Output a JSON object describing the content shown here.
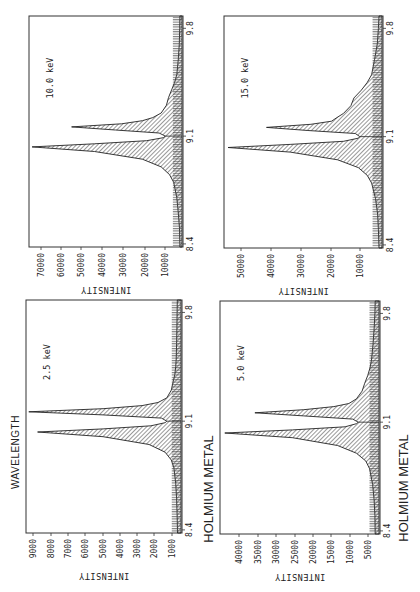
{
  "chart_data": [
    {
      "type": "area",
      "title": "10.0 keV",
      "xlabel": "WAVELENGTH",
      "ylabel": "INTENSITY",
      "x_ticks": [
        "8.4",
        "9.1",
        "9.8"
      ],
      "y_ticks": [
        "10000",
        "20000",
        "30000",
        "40000",
        "50000",
        "60000",
        "70000"
      ],
      "ylim": [
        3000,
        76000
      ],
      "xlim": [
        8.38,
        9.88
      ],
      "series": [
        {
          "name": "Holmium metal 10.0 keV",
          "x": [
            8.38,
            8.5,
            8.6,
            8.7,
            8.8,
            8.85,
            8.9,
            8.95,
            9.0,
            9.03,
            9.05,
            9.07,
            9.09,
            9.1,
            9.12,
            9.14,
            9.16,
            9.18,
            9.2,
            9.22,
            9.25,
            9.3,
            9.35,
            9.4,
            9.45,
            9.5,
            9.6,
            9.7,
            9.8,
            9.88
          ],
          "y": [
            4000,
            4200,
            4800,
            5500,
            7000,
            9000,
            13000,
            22000,
            45000,
            75000,
            45000,
            20000,
            12000,
            11000,
            14000,
            35000,
            56000,
            32000,
            22000,
            17000,
            13000,
            10500,
            9500,
            8000,
            6500,
            5500,
            4800,
            4300,
            4100,
            4000
          ]
        }
      ],
      "annotations": [
        "10.0 keV"
      ],
      "grid": false
    },
    {
      "type": "area",
      "title": "15.0 keV",
      "xlabel": "WAVELENGTH",
      "ylabel": "INTENSITY",
      "x_ticks": [
        "8.4",
        "9.1",
        "9.8"
      ],
      "y_ticks": [
        "10000",
        "20000",
        "30000",
        "40000",
        "50000"
      ],
      "ylim": [
        2000,
        55000
      ],
      "xlim": [
        8.38,
        9.88
      ],
      "series": [
        {
          "name": "Holmium metal 15.0 keV",
          "x": [
            8.38,
            8.5,
            8.6,
            8.7,
            8.8,
            8.85,
            8.9,
            8.95,
            9.0,
            9.03,
            9.05,
            9.07,
            9.09,
            9.1,
            9.12,
            9.14,
            9.16,
            9.18,
            9.2,
            9.22,
            9.25,
            9.3,
            9.35,
            9.4,
            9.45,
            9.5,
            9.6,
            9.7,
            9.8,
            9.88
          ],
          "y": [
            3000,
            3200,
            3500,
            4200,
            5500,
            7000,
            10000,
            17000,
            33000,
            54000,
            33000,
            15000,
            10000,
            9500,
            11000,
            27000,
            41000,
            26000,
            19000,
            17500,
            15000,
            12500,
            11500,
            9000,
            7000,
            5500,
            4500,
            3600,
            3200,
            3000
          ]
        }
      ],
      "annotations": [
        "15.0 keV"
      ],
      "grid": false
    },
    {
      "type": "area",
      "title": "2.5 keV",
      "xlabel": "WAVELENGTH",
      "ylabel": "INTENSITY",
      "x_ticks": [
        "8.4",
        "9.1",
        "9.8"
      ],
      "y_ticks": [
        "1000",
        "2000",
        "3000",
        "4000",
        "5000",
        "6000",
        "7000",
        "8000",
        "9000"
      ],
      "ylim": [
        600,
        9300
      ],
      "xlim": [
        8.38,
        9.88
      ],
      "series": [
        {
          "name": "Holmium metal 2.5 keV",
          "x": [
            8.38,
            8.5,
            8.6,
            8.7,
            8.8,
            8.85,
            8.9,
            8.95,
            9.0,
            9.03,
            9.05,
            9.07,
            9.09,
            9.1,
            9.12,
            9.14,
            9.16,
            9.18,
            9.2,
            9.22,
            9.25,
            9.3,
            9.35,
            9.4,
            9.45,
            9.5,
            9.6,
            9.7,
            9.8,
            9.88
          ],
          "y": [
            800,
            820,
            850,
            900,
            1000,
            1150,
            1500,
            2400,
            5000,
            8700,
            5000,
            2300,
            1500,
            1400,
            1700,
            5000,
            9200,
            5000,
            2800,
            1900,
            1400,
            1150,
            1050,
            950,
            900,
            870,
            850,
            830,
            820,
            810
          ]
        }
      ],
      "annotations": [
        "2.5 keV"
      ],
      "grid": false
    },
    {
      "type": "area",
      "title": "5.0 keV",
      "xlabel": "WAVELENGTH",
      "ylabel": "INTENSITY",
      "x_ticks": [
        "8.4",
        "9.1",
        "9.8"
      ],
      "y_ticks": [
        "5000",
        "10000",
        "15000",
        "20000",
        "25000",
        "30000",
        "35000",
        "40000"
      ],
      "ylim": [
        2000,
        44000
      ],
      "xlim": [
        8.38,
        9.88
      ],
      "series": [
        {
          "name": "Holmium metal 5.0 keV",
          "x": [
            8.38,
            8.5,
            8.6,
            8.7,
            8.8,
            8.85,
            8.9,
            8.95,
            9.0,
            9.03,
            9.05,
            9.07,
            9.09,
            9.1,
            9.12,
            9.14,
            9.16,
            9.18,
            9.2,
            9.22,
            9.25,
            9.3,
            9.35,
            9.4,
            9.45,
            9.5,
            9.6,
            9.7,
            9.8,
            9.88
          ],
          "y": [
            3000,
            3100,
            3300,
            3700,
            4500,
            5500,
            8000,
            13000,
            25000,
            43000,
            25000,
            11000,
            8000,
            7500,
            9000,
            22000,
            35000,
            22000,
            14000,
            10000,
            8000,
            6500,
            5800,
            5000,
            4400,
            4000,
            3600,
            3300,
            3100,
            3000
          ]
        }
      ],
      "annotations": [
        "5.0 keV"
      ],
      "grid": false
    }
  ],
  "labels": {
    "wavelength": "WAVELENGTH",
    "holmium_left": "HOLMIUM METAL",
    "holmium_right": "HOLMIUM METAL",
    "intensity": "INTENSITY"
  },
  "panels": [
    {
      "id": "p10",
      "energy": "10.0 keV",
      "frame": {
        "left": 29,
        "top": 16,
        "right": 183,
        "bottom": 247
      },
      "y_tick_px": [
        165,
        145,
        123,
        102,
        81,
        61,
        41
      ]
    },
    {
      "id": "p15",
      "energy": "15.0 keV",
      "frame": {
        "left": 224,
        "top": 16,
        "right": 383,
        "bottom": 248
      },
      "y_tick_px": [
        360,
        331,
        301,
        271,
        241
      ]
    },
    {
      "id": "p25",
      "energy": "2.5 keV",
      "frame": {
        "left": 26,
        "top": 300,
        "right": 182,
        "bottom": 533
      },
      "y_tick_px": [
        172,
        154,
        137,
        120,
        103,
        85,
        68,
        51,
        33
      ]
    },
    {
      "id": "p5",
      "energy": "5.0 keV",
      "frame": {
        "left": 220,
        "top": 301,
        "right": 380,
        "bottom": 534
      },
      "y_tick_px": [
        368,
        350,
        331,
        313,
        295,
        276,
        258,
        239
      ]
    }
  ]
}
